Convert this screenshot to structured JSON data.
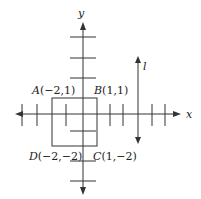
{
  "diagram": {
    "type": "coordinate-plane",
    "axes": {
      "x_label": "x",
      "y_label": "y"
    },
    "line": {
      "label": "l",
      "orientation": "vertical",
      "arrows": "both"
    },
    "square": {
      "vertices": [
        {
          "name": "A",
          "coord": "(−2,1)",
          "label": "A(−2,1)"
        },
        {
          "name": "B",
          "coord": "(1,1)",
          "label": "B(1,1)"
        },
        {
          "name": "C",
          "coord": "(1,−2)",
          "label": "C(1,−2)"
        },
        {
          "name": "D",
          "coord": "(−2,−2)",
          "label": "D(−2,−2)"
        }
      ]
    },
    "labels": {
      "A": "A",
      "A_coord": "(−2,1)",
      "B": "B",
      "B_coord": "(1,1)",
      "C": "C",
      "C_coord": "(1,−2)",
      "D": "D",
      "D_coord": "(−2,−2)"
    },
    "colors": {
      "stroke": "#333333",
      "text": "#222222",
      "background": "#ffffff"
    }
  }
}
